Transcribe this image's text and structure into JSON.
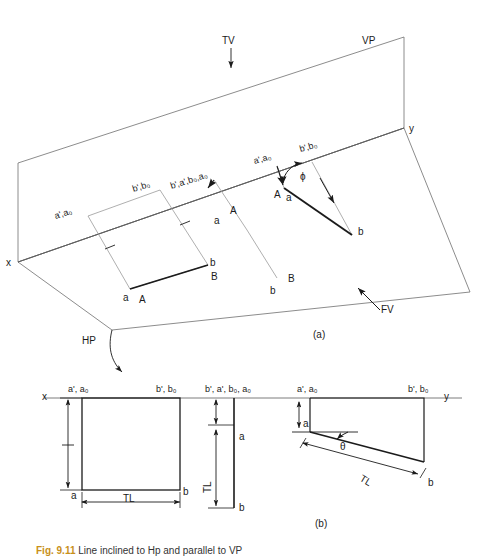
{
  "figure": {
    "caption_label": "Fig. 9.11",
    "caption_text": " Line inclined to Hp and parallel to VP",
    "panel_a_label": "(a)",
    "panel_b_label": "(b)"
  },
  "panel_a": {
    "plane_labels": {
      "tv": "TV",
      "vp": "VP",
      "hp": "HP",
      "fv": "FV"
    },
    "axis_labels": {
      "x": "x",
      "y": "y"
    },
    "top_view_square": {
      "corner_a_prime": "a',a₀",
      "corner_b_prime": "b',b₀",
      "point_a_lower": "a",
      "point_b_lower": "b",
      "edge_A": "A",
      "edge_B": "B"
    },
    "middle_projector": {
      "joint_label": "b',a',b₀,a₀",
      "point_a": "a",
      "point_b": "b",
      "line_A": "A",
      "line_B": "B"
    },
    "front_view": {
      "corner_a_prime": "a',a₀",
      "corner_b_prime": "b',b₀",
      "vertex_A": "A",
      "vertex_a": "a",
      "point_b": "b",
      "point_B": "B",
      "angle_phi": "ϕ"
    }
  },
  "panel_b": {
    "view1": {
      "x_axis": "x",
      "top_left": "a', a₀",
      "top_right": "b', b₀",
      "bottom_left": "a",
      "bottom_right": "b",
      "dim_horizontal": "TL"
    },
    "view2": {
      "top_label": "b', a', b₀, a₀",
      "point_a": "a",
      "point_b": "b",
      "dim_vertical": "TL"
    },
    "view3": {
      "top_left": "a', a₀",
      "top_right": "b', b₀",
      "y_axis": "y",
      "point_a": "a",
      "point_b": "b",
      "angle_theta": "θ",
      "dim_true_length": "TL"
    }
  },
  "colors": {
    "stroke_dark": "#1b1b1b",
    "stroke_light": "#8a8a8a",
    "background": "#ffffff",
    "caption_accent": "#c8901a"
  }
}
